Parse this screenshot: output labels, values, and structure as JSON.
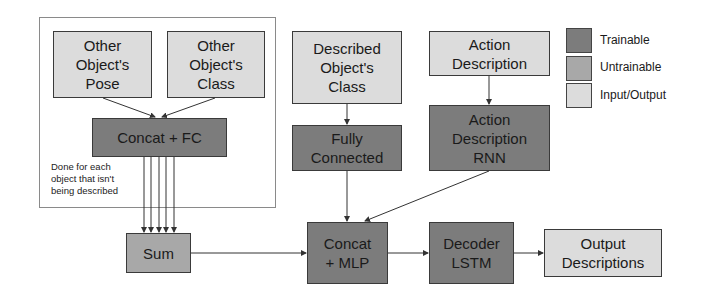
{
  "diagram": {
    "group_frame": {
      "note": "Done for each\nobject that isn't\nbeing described"
    },
    "nodes": {
      "other_pose": {
        "label": "Other\nObject's\nPose",
        "kind": "io"
      },
      "other_class": {
        "label": "Other\nObject's\nClass",
        "kind": "io"
      },
      "concat_fc": {
        "label": "Concat + FC",
        "kind": "trainable"
      },
      "sum": {
        "label": "Sum",
        "kind": "untrainable"
      },
      "described_class": {
        "label": "Described\nObject's\nClass",
        "kind": "io"
      },
      "fully_connected": {
        "label": "Fully\nConnected",
        "kind": "trainable"
      },
      "action_desc": {
        "label": "Action\nDescription",
        "kind": "io"
      },
      "action_rnn": {
        "label": "Action\nDescription\nRNN",
        "kind": "trainable"
      },
      "concat_mlp": {
        "label": "Concat\n+ MLP",
        "kind": "trainable"
      },
      "decoder_lstm": {
        "label": "Decoder\nLSTM",
        "kind": "trainable"
      },
      "output_desc": {
        "label": "Output\nDescriptions",
        "kind": "io"
      }
    },
    "edges": [
      [
        "other_pose",
        "concat_fc"
      ],
      [
        "other_class",
        "concat_fc"
      ],
      [
        "concat_fc",
        "sum",
        "x5"
      ],
      [
        "sum",
        "concat_mlp"
      ],
      [
        "described_class",
        "fully_connected"
      ],
      [
        "fully_connected",
        "concat_mlp"
      ],
      [
        "action_desc",
        "action_rnn"
      ],
      [
        "action_rnn",
        "concat_mlp"
      ],
      [
        "concat_mlp",
        "decoder_lstm"
      ],
      [
        "decoder_lstm",
        "output_desc"
      ]
    ],
    "legend": [
      {
        "label": "Trainable",
        "color": "#7c7c7c"
      },
      {
        "label": "Untrainable",
        "color": "#a8a8a8"
      },
      {
        "label": "Input/Output",
        "color": "#dcdcdc"
      }
    ]
  }
}
